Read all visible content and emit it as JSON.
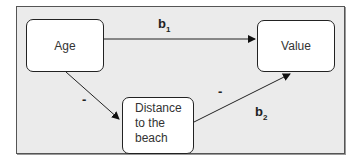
{
  "diagram": {
    "nodes": {
      "age": "Age",
      "value": "Value",
      "distance": [
        "Distance",
        "to the",
        "beach"
      ]
    },
    "edges": [
      {
        "from": "Age",
        "to": "Value",
        "label": "b",
        "subscript": "1"
      },
      {
        "from": "Age",
        "to": "Distance to the beach",
        "label": "-"
      },
      {
        "from": "Distance to the beach",
        "to": "Value",
        "label": "-",
        "coefficient": "b",
        "subscript": "2"
      }
    ],
    "labels": {
      "b1": "b",
      "b1_sub": "1",
      "minus_left": "-",
      "minus_right": "-",
      "b2": "b",
      "b2_sub": "2"
    }
  }
}
